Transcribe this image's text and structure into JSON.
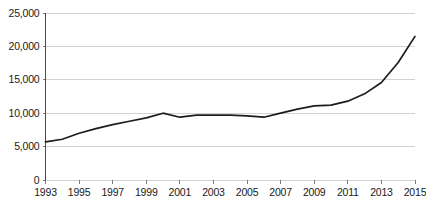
{
  "chart_data": {
    "type": "line",
    "title": "",
    "subtitle": "",
    "xlabel": "",
    "ylabel": "",
    "grid": "horizontal",
    "legend": "none",
    "xlim": [
      1993,
      2015
    ],
    "ylim": [
      0,
      25000
    ],
    "ytick_values": [
      0,
      5000,
      10000,
      15000,
      20000,
      25000
    ],
    "ytick_labels": [
      "0",
      "5,000",
      "10,000",
      "15,000",
      "20,000",
      "25,000"
    ],
    "xtick_values": [
      1993,
      1995,
      1997,
      1999,
      2001,
      2003,
      2005,
      2007,
      2009,
      2011,
      2013,
      2015
    ],
    "xtick_labels": [
      "1993",
      "1995",
      "1997",
      "1999",
      "2001",
      "2003",
      "2005",
      "2007",
      "2009",
      "2011",
      "2013",
      "2015"
    ],
    "line_color": "#1c1c1c",
    "grid_color": "#c8c8c8",
    "axis_color": "#4a4a4a",
    "x": [
      1993,
      1994,
      1995,
      1996,
      1997,
      1998,
      1999,
      2000,
      2001,
      2002,
      2003,
      2004,
      2005,
      2006,
      2007,
      2008,
      2009,
      2010,
      2011,
      2012,
      2013,
      2014,
      2015
    ],
    "values": [
      5700,
      6100,
      7000,
      7700,
      8300,
      8800,
      9300,
      10000,
      9400,
      9700,
      9700,
      9700,
      9600,
      9400,
      10000,
      10600,
      11100,
      11200,
      11800,
      12900,
      14600,
      17600,
      21500
    ],
    "series": [
      {
        "name": "series-1",
        "values": [
          5700,
          6100,
          7000,
          7700,
          8300,
          8800,
          9300,
          10000,
          9400,
          9700,
          9700,
          9700,
          9600,
          9400,
          10000,
          10600,
          11100,
          11200,
          11800,
          12900,
          14600,
          17600,
          21500
        ]
      }
    ]
  }
}
